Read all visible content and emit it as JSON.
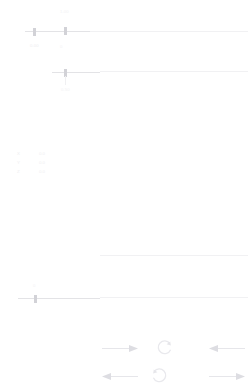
{
  "canvas": {
    "width": 251,
    "height": 390,
    "background": "#ffffff",
    "line_color": "#ececee",
    "text_color": "#eeeef0"
  },
  "sliders": [
    {
      "name": "top-slider",
      "track_label_left": "0",
      "value_label": "0.00",
      "max_label": "1.00",
      "handle_position_pct": 18
    },
    {
      "name": "second-slider",
      "track_label_left": "min",
      "value_label": "0.50",
      "max_label": "max",
      "handle_position_pct": 34
    },
    {
      "name": "third-slider",
      "track_label_left": "",
      "value_label": "",
      "max_label": "",
      "handle_position_pct": 0
    },
    {
      "name": "bottom-slider",
      "track_label_left": "0",
      "value_label": "0",
      "max_label": "",
      "handle_position_pct": 13
    }
  ],
  "readout": {
    "rows": [
      {
        "key": "X",
        "value": "0.0"
      },
      {
        "key": "Y",
        "value": "0.0"
      },
      {
        "key": "Z",
        "value": "0.0"
      }
    ]
  },
  "nudge_pad": {
    "controls": [
      {
        "icon": "arrow-right-icon",
        "label": "",
        "direction": "right"
      },
      {
        "icon": "rotate-ccw-icon",
        "label": "",
        "direction": "ccw"
      },
      {
        "icon": "arrow-left-icon",
        "label": "",
        "direction": "left"
      },
      {
        "icon": "arrow-left-icon",
        "label": "",
        "direction": "left"
      },
      {
        "icon": "rotate-cw-icon",
        "label": "",
        "direction": "cw"
      },
      {
        "icon": "arrow-right-icon",
        "label": "",
        "direction": "right"
      }
    ]
  }
}
